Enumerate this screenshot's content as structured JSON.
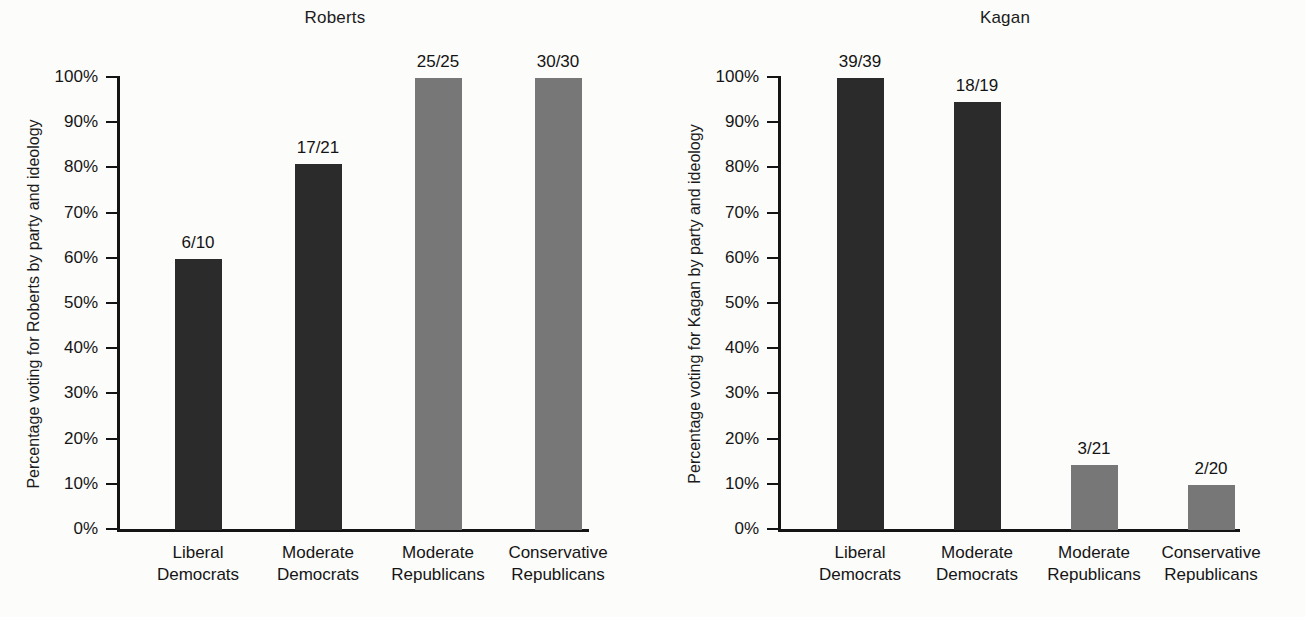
{
  "figure": {
    "background": "#fcfcfb",
    "bar_color_dark": "#2b2b2b",
    "bar_color_light": "#777777",
    "axis_color": "#141414"
  },
  "chart_data": [
    {
      "type": "bar",
      "title": "Roberts",
      "xlabel": "",
      "ylabel": "Percentage voting for Roberts by party and ideology",
      "ylim": [
        0,
        100
      ],
      "grid": false,
      "legend": "none",
      "categories": [
        "Liberal Democrats",
        "Moderate Democrats",
        "Moderate Republicans",
        "Conservative Republicans"
      ],
      "category_lines": [
        [
          "Liberal",
          "Democrats"
        ],
        [
          "Moderate",
          "Democrats"
        ],
        [
          "Moderate",
          "Republicans"
        ],
        [
          "Conservative",
          "Republicans"
        ]
      ],
      "values": [
        60.0,
        81.0,
        100.0,
        100.0
      ],
      "data_labels": [
        "6/10",
        "17/21",
        "25/25",
        "30/30"
      ],
      "bar_shades": [
        "dark",
        "dark",
        "light",
        "light"
      ],
      "ytick_labels": [
        "100%",
        "90%",
        "80%",
        "70%",
        "60%",
        "50%",
        "40%",
        "30%",
        "20%",
        "10%",
        "0%"
      ],
      "ytick_values": [
        100,
        90,
        80,
        70,
        60,
        50,
        40,
        30,
        20,
        10,
        0
      ]
    },
    {
      "type": "bar",
      "title": "Kagan",
      "xlabel": "",
      "ylabel": "Percentage voting for Kagan by party and ideology",
      "ylim": [
        0,
        100
      ],
      "grid": false,
      "legend": "none",
      "categories": [
        "Liberal Democrats",
        "Moderate Democrats",
        "Moderate Republicans",
        "Conservative Republicans"
      ],
      "category_lines": [
        [
          "Liberal",
          "Democrats"
        ],
        [
          "Moderate",
          "Democrats"
        ],
        [
          "Moderate",
          "Republicans"
        ],
        [
          "Conservative",
          "Republicans"
        ]
      ],
      "values": [
        100.0,
        94.7,
        14.3,
        10.0
      ],
      "data_labels": [
        "39/39",
        "18/19",
        "3/21",
        "2/20"
      ],
      "bar_shades": [
        "dark",
        "dark",
        "light",
        "light"
      ],
      "ytick_labels": [
        "100%",
        "90%",
        "80%",
        "70%",
        "60%",
        "50%",
        "40%",
        "30%",
        "20%",
        "10%",
        "0%"
      ],
      "ytick_values": [
        100,
        90,
        80,
        70,
        60,
        50,
        40,
        30,
        20,
        10,
        0
      ]
    }
  ]
}
